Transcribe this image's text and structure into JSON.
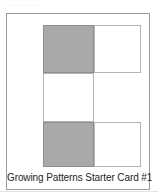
{
  "page": {
    "scan_artifact_text": "— —  ——  —",
    "background_color": "#ffffff"
  },
  "card": {
    "caption": "Growing Patterns Starter Card #1",
    "frame_color": "#9b9b9e",
    "colors": {
      "filled": "#a9a9a9",
      "empty": "#ffffff",
      "cell_border": "#b4b4b6",
      "filled_border": "#8e8e90",
      "caption_text": "#25252a"
    },
    "grid": {
      "rows": 3,
      "columns": 2,
      "cells": [
        {
          "row": 0,
          "col": 0,
          "state": "filled"
        },
        {
          "row": 0,
          "col": 1,
          "state": "empty"
        },
        {
          "row": 1,
          "col": 0,
          "state": "empty"
        },
        {
          "row": 1,
          "col": 1,
          "state": "blank"
        },
        {
          "row": 2,
          "col": 0,
          "state": "filled"
        },
        {
          "row": 2,
          "col": 1,
          "state": "empty"
        }
      ]
    }
  }
}
